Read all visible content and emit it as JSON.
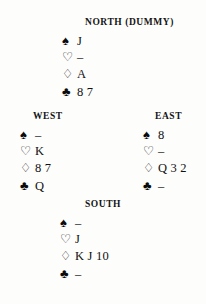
{
  "diagram": {
    "background_color": "#fdfdfc",
    "text_color": "#111111"
  },
  "suit_symbols": {
    "spade": "♠",
    "heart": "♡",
    "diamond": "♢",
    "club": "♣"
  },
  "void_marker": "–",
  "hands": {
    "north": {
      "label": "NORTH (DUMMY)",
      "label_main": "N",
      "position": "north",
      "suits": {
        "spades": "J",
        "hearts": "–",
        "diamonds": "A",
        "clubs": "8 7"
      },
      "cards": {
        "spades": [
          "J"
        ],
        "hearts": [],
        "diamonds": [
          "A"
        ],
        "clubs": [
          "8",
          "7"
        ]
      }
    },
    "west": {
      "label": "WEST",
      "position": "west",
      "suits": {
        "spades": "–",
        "hearts": "K",
        "diamonds": "8 7",
        "clubs": "Q"
      },
      "cards": {
        "spades": [],
        "hearts": [
          "K"
        ],
        "diamonds": [
          "8",
          "7"
        ],
        "clubs": [
          "Q"
        ]
      }
    },
    "east": {
      "label": "EAST",
      "position": "east",
      "suits": {
        "spades": "8",
        "hearts": "–",
        "diamonds": "Q 3 2",
        "clubs": "–"
      },
      "cards": {
        "spades": [
          "8"
        ],
        "hearts": [],
        "diamonds": [
          "Q",
          "3",
          "2"
        ],
        "clubs": []
      }
    },
    "south": {
      "label": "SOUTH",
      "position": "south",
      "suits": {
        "spades": "–",
        "hearts": "J",
        "diamonds": "K J 10",
        "clubs": "–"
      },
      "cards": {
        "spades": [],
        "hearts": [
          "J"
        ],
        "diamonds": [
          "K",
          "J",
          "10"
        ],
        "clubs": []
      }
    }
  }
}
